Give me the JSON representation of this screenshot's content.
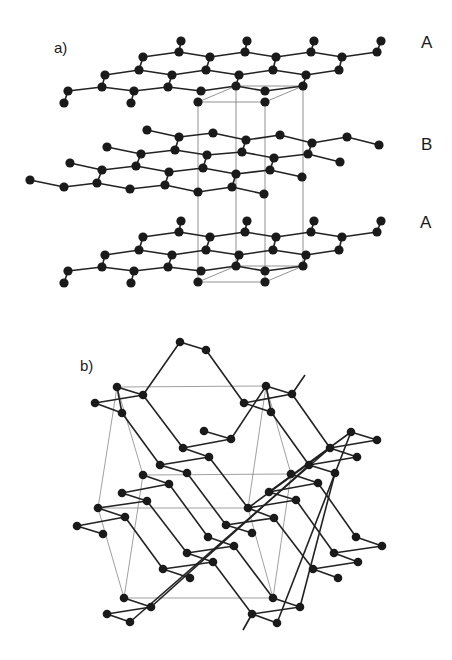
{
  "figure": {
    "panels": [
      {
        "id": "a",
        "label": "a)",
        "layer_labels": [
          "A",
          "B",
          "A"
        ],
        "description": "Layered hexagonal sheets stacked ABA with unit cell outlined"
      },
      {
        "id": "b",
        "label": "b)",
        "description": "Three-dimensional puckered network with unit cell outlined"
      }
    ],
    "colors": {
      "atom": "#1a1a1a",
      "bond": "#222222",
      "cell": "#666666",
      "background": "#ffffff"
    }
  },
  "panel_a": {
    "label": "a)",
    "layer_top": "A",
    "layer_middle": "B",
    "layer_bottom": "A"
  },
  "panel_b": {
    "label": "b)"
  }
}
